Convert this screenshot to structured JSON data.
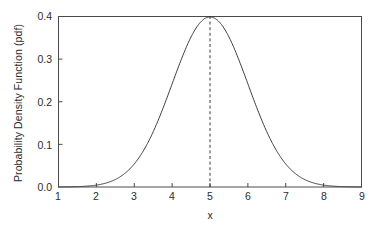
{
  "chart_data": {
    "type": "line",
    "title": "",
    "subtitle": "",
    "xlabel": "x",
    "ylabel": "Probability Density Function (pdf)",
    "xlim": [
      1,
      9
    ],
    "ylim": [
      0.0,
      0.4
    ],
    "xticks": [
      1,
      2,
      3,
      4,
      5,
      6,
      7,
      8,
      9
    ],
    "xtick_labels": [
      "1",
      "2",
      "3",
      "4",
      "5",
      "6",
      "7",
      "8",
      "9"
    ],
    "yticks": [
      0.0,
      0.1,
      0.2,
      0.3,
      0.4
    ],
    "ytick_labels": [
      "0.0",
      "0.1",
      "0.2",
      "0.3",
      "0.4"
    ],
    "grid": false,
    "legend": null,
    "tick_direction": "in",
    "frame": "full-box",
    "series": [
      {
        "name": "normal pdf (mean=5, sd=1)",
        "distribution": "normal",
        "mean": 5,
        "sd": 1,
        "peak_value": 0.4,
        "color": "#3a3a3a",
        "linewidth": 1,
        "linestyle": "solid",
        "x": [
          1.0,
          1.25,
          1.5,
          1.75,
          2.0,
          2.25,
          2.5,
          2.75,
          3.0,
          3.25,
          3.5,
          3.75,
          4.0,
          4.25,
          4.5,
          4.75,
          5.0,
          5.25,
          5.5,
          5.75,
          6.0,
          6.25,
          6.5,
          6.75,
          7.0,
          7.25,
          7.5,
          7.75,
          8.0,
          8.25,
          8.5,
          8.75,
          9.0
        ],
        "y": [
          0.0001,
          0.0004,
          0.0009,
          0.0022,
          0.0044,
          0.0088,
          0.0175,
          0.0317,
          0.054,
          0.0863,
          0.1295,
          0.1826,
          0.242,
          0.3011,
          0.3521,
          0.3867,
          0.3989,
          0.3867,
          0.3521,
          0.3011,
          0.242,
          0.1826,
          0.1295,
          0.0863,
          0.054,
          0.0317,
          0.0175,
          0.0088,
          0.0044,
          0.0022,
          0.0009,
          0.0004,
          0.0001
        ]
      }
    ],
    "annotations": [
      {
        "name": "mean-reference-line",
        "type": "vline",
        "x": 5,
        "y_from": 0.0,
        "y_to": 0.3989,
        "linestyle": "dashed",
        "color": "#3a3a3a"
      }
    ]
  },
  "axes": {
    "frame_color": "#4a4a4a",
    "text_color": "#2b2b2b"
  }
}
